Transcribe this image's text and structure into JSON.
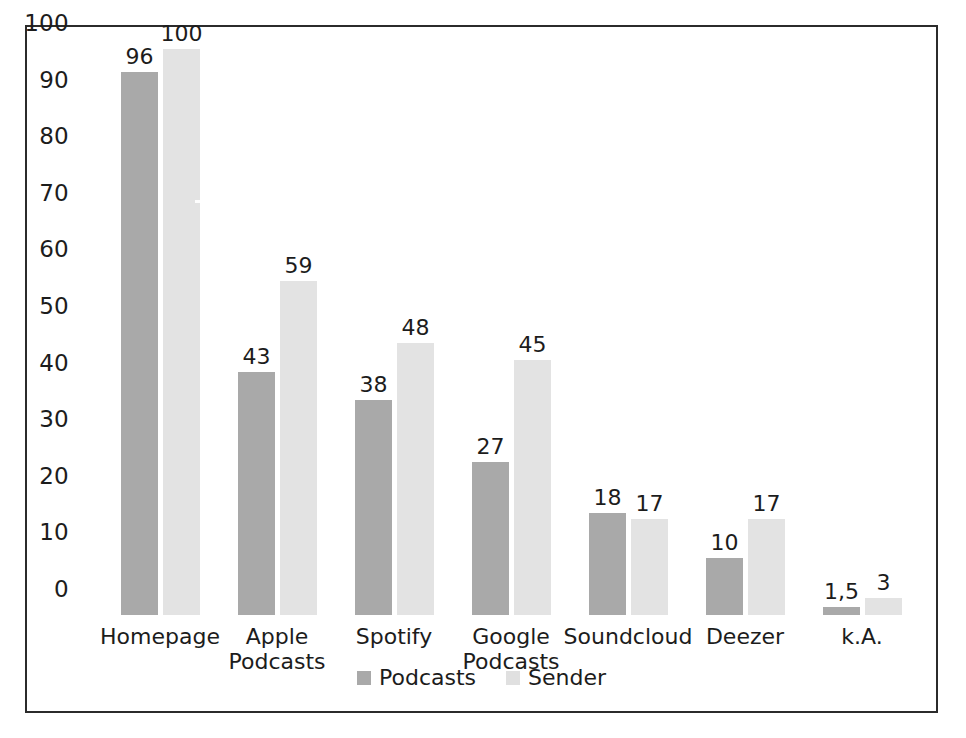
{
  "chart_data": {
    "type": "bar",
    "title": "",
    "xlabel": "",
    "ylabel": "",
    "ylim": [
      0,
      100
    ],
    "yticks": [
      100,
      90,
      80,
      70,
      60,
      50,
      40,
      30,
      20,
      10,
      0
    ],
    "grid": false,
    "legend_position": "bottom-center",
    "categories": [
      "Homepage",
      "Apple\nPodcasts",
      "Spotify",
      "Google\nPodcasts",
      "Soundcloud",
      "Deezer",
      "k.A."
    ],
    "category_lines": [
      [
        "Homepage"
      ],
      [
        "Apple",
        "Podcasts"
      ],
      [
        "Spotify"
      ],
      [
        "Google",
        "Podcasts"
      ],
      [
        "Soundcloud"
      ],
      [
        "Deezer"
      ],
      [
        "k.A."
      ]
    ],
    "series": [
      {
        "name": "Podcasts",
        "color": "#a9a9a9",
        "values": [
          96,
          43,
          38,
          27,
          18,
          10,
          1.5
        ],
        "labels": [
          "96",
          "43",
          "38",
          "27",
          "18",
          "10",
          "1,5"
        ]
      },
      {
        "name": "Sender",
        "color": "#e3e3e3",
        "values": [
          100,
          59,
          48,
          45,
          17,
          17,
          3
        ],
        "labels": [
          "100",
          "59",
          "48",
          "45",
          "17",
          "17",
          "3"
        ]
      }
    ]
  },
  "legend": {
    "items": [
      {
        "label": "Podcasts",
        "color": "#a9a9a9"
      },
      {
        "label": "Sender",
        "color": "#e0e0e0"
      }
    ]
  },
  "colors": {
    "series_podcasts": "#a9a9a9",
    "series_sender": "#e3e3e3",
    "frame_border": "#2b2b2b",
    "text": "#1c1c1c",
    "background": "#ffffff"
  }
}
